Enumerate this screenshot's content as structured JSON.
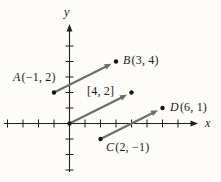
{
  "figure": {
    "title_hidden": "",
    "colors": {
      "background": "#fdfcf9",
      "axis": "#1f1f1f",
      "vector": "#6e6e6e",
      "dot": "#141414",
      "text": "#1b1b1b"
    },
    "origin_px": {
      "x": 69.5,
      "y": 123.5
    },
    "unit_px": 15.5,
    "x_axis": {
      "label": "x",
      "y_px": 123.5,
      "x_from": 4,
      "x_to": 191,
      "tip_px": 198,
      "ticks": [
        -4,
        -3,
        -2,
        -1,
        1,
        2,
        3,
        4,
        5,
        6,
        7
      ]
    },
    "y_axis": {
      "label": "y",
      "x_px": 69.5,
      "y_from": 172,
      "y_to": 31,
      "tip_px": 24,
      "ticks": [
        -3,
        -2,
        -1,
        1,
        2,
        3,
        4,
        5
      ]
    },
    "vectors": [
      {
        "name": "vector-ab",
        "from": [
          -1,
          2
        ],
        "to": [
          3,
          4
        ]
      },
      {
        "name": "vector-origin-42",
        "from": [
          0,
          0
        ],
        "to": [
          4,
          2
        ]
      },
      {
        "name": "vector-cd",
        "from": [
          2,
          -1
        ],
        "to": [
          6,
          1
        ]
      }
    ],
    "dots": [
      {
        "name": "point-a-dot",
        "at": [
          -1,
          2
        ]
      },
      {
        "name": "point-b-dot",
        "at": [
          3,
          4
        ]
      },
      {
        "name": "origin-dot",
        "at": [
          0,
          0
        ]
      },
      {
        "name": "point-42-dot",
        "at": [
          4,
          2
        ]
      },
      {
        "name": "point-c-dot",
        "at": [
          2,
          -1
        ]
      },
      {
        "name": "point-d-dot",
        "at": [
          6,
          1
        ]
      }
    ],
    "labels": [
      {
        "name": "point-a",
        "italic": "A",
        "text": "(−1, 2)",
        "left": 13,
        "top": 70
      },
      {
        "name": "point-b",
        "italic": "B",
        "text": "(3, 4)",
        "left": 123,
        "top": 53
      },
      {
        "name": "component-vector",
        "italic": "",
        "text": "[4, 2]",
        "left": 87,
        "top": 84
      },
      {
        "name": "point-c",
        "italic": "C",
        "text": "(2, −1)",
        "left": 106,
        "top": 140
      },
      {
        "name": "point-d",
        "italic": "D",
        "text": "(6, 1)",
        "left": 170,
        "top": 100
      },
      {
        "name": "x-axis",
        "italic": "x",
        "text": "",
        "left": 205,
        "top": 116
      },
      {
        "name": "y-axis",
        "italic": "y",
        "text": "",
        "left": 64,
        "top": 5
      }
    ]
  }
}
